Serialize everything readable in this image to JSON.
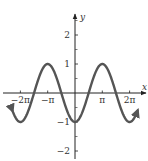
{
  "chart_data": {
    "type": "line",
    "title": "",
    "function": "y = -cos(x)",
    "xlabel": "x",
    "ylabel": "y",
    "xlim": [
      -7.33,
      7.33
    ],
    "ylim": [
      -2.4,
      2.6
    ],
    "x_range_plotted": [
      -7.2,
      7.2
    ],
    "x_ticks": [
      {
        "value": -6.2832,
        "label": "−2π"
      },
      {
        "value": -3.1416,
        "label": "−π"
      },
      {
        "value": 3.1416,
        "label": "π"
      },
      {
        "value": 6.2832,
        "label": "2π"
      }
    ],
    "y_ticks": [
      {
        "value": 2,
        "label": "2"
      },
      {
        "value": 1,
        "label": "1"
      },
      {
        "value": -1,
        "label": "−1"
      },
      {
        "value": -2,
        "label": "−2"
      }
    ],
    "y_minor_ticks": [
      2.5,
      1.5,
      0.5,
      -0.5,
      -1.5,
      -2.5
    ],
    "series": [
      {
        "name": "y = -cos x",
        "color": "#555555",
        "arrows_both_ends": true
      }
    ],
    "grid": false,
    "legend": "none"
  }
}
